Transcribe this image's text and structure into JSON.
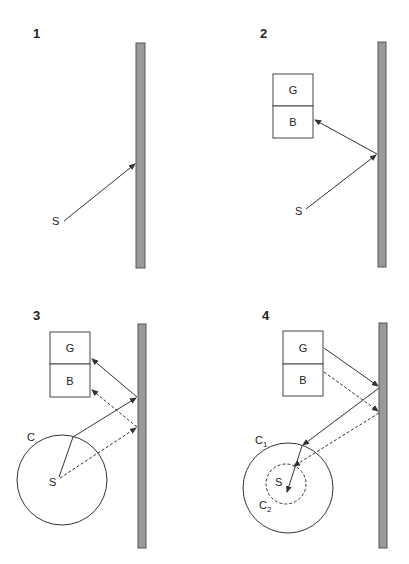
{
  "panels": [
    {
      "number": "1",
      "source_label": "S"
    },
    {
      "number": "2",
      "box_top_label": "G",
      "box_bottom_label": "B",
      "source_label": "S"
    },
    {
      "number": "3",
      "box_top_label": "G",
      "box_bottom_label": "B",
      "source_label": "S",
      "circle_label": "C"
    },
    {
      "number": "4",
      "box_top_label": "G",
      "box_bottom_label": "B",
      "source_label": "S",
      "outer_circle_label": "C",
      "outer_circle_sub": "1",
      "inner_circle_label": "C",
      "inner_circle_sub": "2"
    }
  ],
  "colors": {
    "wall_fill": "#9a9a9a",
    "wall_border": "#555555",
    "line": "#333333"
  }
}
